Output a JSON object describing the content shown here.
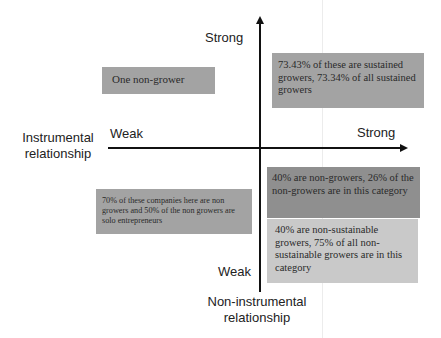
{
  "diagram": {
    "type": "quadrant-matrix",
    "colors": {
      "box_medium": "#a3a3a3",
      "box_dark": "#8f8f8f",
      "box_light": "#c9c9c9",
      "axis": "#111111"
    },
    "vertical_axis": {
      "top_label": "Strong",
      "bottom_label": "Weak",
      "title": "Non-instrumental relationship",
      "title_line1": "Non-instrumental",
      "title_line2": "relationship"
    },
    "horizontal_axis": {
      "left_label": "Weak",
      "right_label": "Strong",
      "title": "Instrumental relationship",
      "title_line1": "Instrumental",
      "title_line2": "relationship"
    },
    "quadrants": {
      "top_left": {
        "text": "One non-grower"
      },
      "top_right": {
        "text": "73.43% of these are sustained growers, 73.34% of all sustained growers"
      },
      "bottom_left": {
        "text": "70% of these companies here are non growers and 50% of the non growers are solo entrepreneurs"
      },
      "bottom_right_upper": {
        "text": "40% are non-growers, 26% of the non-growers are in this category"
      },
      "bottom_right_lower": {
        "text": "40% are non-sustainable growers, 75% of all non-sustainable growers are in this category"
      }
    }
  }
}
